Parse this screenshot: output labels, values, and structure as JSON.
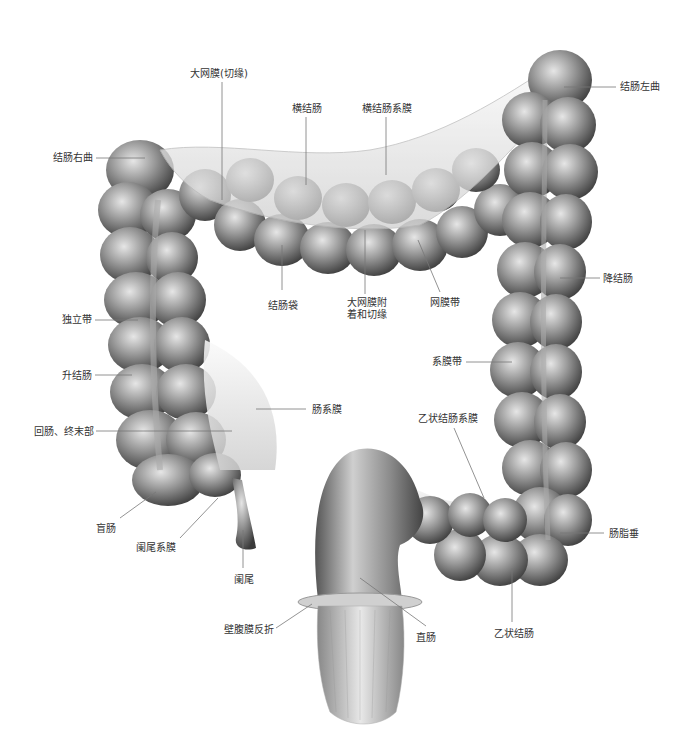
{
  "figure": {
    "labels": [
      {
        "id": "greater-omentum-cut",
        "text": "大网膜(切缘)",
        "x": 190,
        "y": 68,
        "lx1": 222,
        "ly1": 82,
        "lx2": 222,
        "ly2": 200
      },
      {
        "id": "transverse-colon",
        "text": "横结肠",
        "x": 292,
        "y": 103,
        "lx1": 306,
        "ly1": 117,
        "lx2": 306,
        "ly2": 185
      },
      {
        "id": "transverse-mesocolon",
        "text": "横结肠系膜",
        "x": 362,
        "y": 103,
        "lx1": 386,
        "ly1": 117,
        "lx2": 386,
        "ly2": 175
      },
      {
        "id": "left-colic-flexure",
        "text": "结肠左曲",
        "x": 620,
        "y": 81,
        "lx1": 564,
        "ly1": 87,
        "lx2": 616,
        "ly2": 87
      },
      {
        "id": "right-colic-flexure",
        "text": "结肠右曲",
        "x": 53,
        "y": 152,
        "lx1": 96,
        "ly1": 158,
        "lx2": 145,
        "ly2": 158
      },
      {
        "id": "haustra",
        "text": "结肠袋",
        "x": 268,
        "y": 300,
        "lx1": 282,
        "ly1": 290,
        "lx2": 282,
        "ly2": 245
      },
      {
        "id": "omentum-attachment",
        "text": "大网膜附",
        "text2": "着和切缘",
        "x": 347,
        "y": 297,
        "lx1": 365,
        "ly1": 294,
        "lx2": 365,
        "ly2": 230
      },
      {
        "id": "omental-band",
        "text": "网膜带",
        "x": 430,
        "y": 297,
        "lx1": 440,
        "ly1": 292,
        "lx2": 418,
        "ly2": 240
      },
      {
        "id": "descending-colon",
        "text": "降结肠",
        "x": 603,
        "y": 273,
        "lx1": 560,
        "ly1": 278,
        "lx2": 600,
        "ly2": 278
      },
      {
        "id": "free-band",
        "text": "独立带",
        "x": 62,
        "y": 314,
        "lx1": 95,
        "ly1": 320,
        "lx2": 138,
        "ly2": 320
      },
      {
        "id": "mesocolic-band",
        "text": "系膜带",
        "x": 432,
        "y": 356,
        "lx1": 466,
        "ly1": 362,
        "lx2": 512,
        "ly2": 362
      },
      {
        "id": "ascending-colon",
        "text": "升结肠",
        "x": 62,
        "y": 370,
        "lx1": 95,
        "ly1": 375,
        "lx2": 132,
        "ly2": 375
      },
      {
        "id": "mesentery",
        "text": "肠系膜",
        "x": 312,
        "y": 404,
        "lx1": 256,
        "ly1": 409,
        "lx2": 306,
        "ly2": 409
      },
      {
        "id": "ileum-terminal",
        "text": "回肠、终末部",
        "x": 34,
        "y": 426,
        "lx1": 96,
        "ly1": 431,
        "lx2": 232,
        "ly2": 431
      },
      {
        "id": "sigmoid-mesocolon",
        "text": "乙状结肠系膜",
        "x": 418,
        "y": 413,
        "lx1": 454,
        "ly1": 428,
        "lx2": 484,
        "ly2": 498
      },
      {
        "id": "cecum",
        "text": "盲肠",
        "x": 96,
        "y": 523,
        "lx1": 120,
        "ly1": 518,
        "lx2": 156,
        "ly2": 492
      },
      {
        "id": "appendix-mesentery",
        "text": "阑尾系膜",
        "x": 136,
        "y": 542,
        "lx1": 180,
        "ly1": 538,
        "lx2": 218,
        "ly2": 498
      },
      {
        "id": "epiploic-appendices",
        "text": "肠脂垂",
        "x": 609,
        "y": 528,
        "lx1": 560,
        "ly1": 533,
        "lx2": 604,
        "ly2": 533
      },
      {
        "id": "appendix",
        "text": "阑尾",
        "x": 234,
        "y": 574,
        "lx1": 243,
        "ly1": 568,
        "lx2": 243,
        "ly2": 530
      },
      {
        "id": "peritoneal-reflection",
        "text": "壁腹膜反折",
        "x": 224,
        "y": 624,
        "lx1": 276,
        "ly1": 628,
        "lx2": 312,
        "ly2": 604
      },
      {
        "id": "rectum",
        "text": "直肠",
        "x": 416,
        "y": 632,
        "lx1": 426,
        "ly1": 626,
        "lx2": 360,
        "ly2": 578
      },
      {
        "id": "sigmoid-colon",
        "text": "乙状结肠",
        "x": 494,
        "y": 628,
        "lx1": 512,
        "ly1": 622,
        "lx2": 512,
        "ly2": 568
      }
    ]
  },
  "colors": {
    "background": "#ffffff",
    "label_text": "#333333",
    "leader_line": "#777777",
    "organ_dark": "#4a4a4a",
    "organ_mid": "#8a8a8a",
    "organ_light": "#d8d8d8"
  }
}
